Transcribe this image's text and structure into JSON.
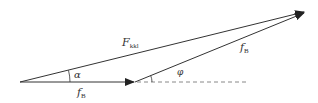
{
  "diagram": {
    "type": "vector-triangle",
    "colors": {
      "line": "#333333",
      "dashed": "#888888",
      "background": "#ffffff"
    },
    "vectors": [
      {
        "name": "F_kkl",
        "label_main": "F",
        "label_sub": "kkl",
        "from": [
          20,
          82
        ],
        "to": [
          305,
          12
        ]
      },
      {
        "name": "f_B_horizontal",
        "label_main": "f",
        "label_sub": "B",
        "from": [
          20,
          82
        ],
        "to": [
          135,
          82
        ]
      },
      {
        "name": "f_B_inclined",
        "label_main": "f",
        "label_sub": "B",
        "from": [
          135,
          82
        ],
        "to": [
          305,
          12
        ]
      }
    ],
    "reference_line": {
      "style": "dashed",
      "from": [
        135,
        82
      ],
      "to": [
        247,
        82
      ]
    },
    "angles": [
      {
        "name": "alpha",
        "symbol": "α",
        "vertex": [
          20,
          82
        ]
      },
      {
        "name": "phi",
        "symbol": "φ",
        "vertex": [
          135,
          82
        ]
      }
    ]
  }
}
